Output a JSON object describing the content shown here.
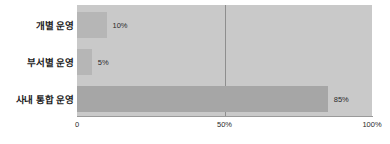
{
  "chart_data": {
    "type": "bar",
    "orientation": "horizontal",
    "title": "",
    "xlabel": "",
    "ylabel": "",
    "categories": [
      "개별 운영",
      "부서별 운영",
      "사내 통합 운영"
    ],
    "values": [
      10,
      5,
      85
    ],
    "value_labels": [
      "10%",
      "5%",
      "85%"
    ],
    "xlim": [
      0,
      100
    ],
    "xticks": [
      0,
      50,
      100
    ],
    "xtick_labels": [
      "0",
      "50%",
      "100%"
    ],
    "grid": true,
    "gridlines_at": [
      50
    ],
    "legend": null,
    "colors": {
      "plot_background": "#c9c9c9",
      "bar_light": "#b6b6b6",
      "bar_dark": "#a6a6a6",
      "gridline": "#8e8e8e",
      "axis_line": "#9a9a9a",
      "text": "#2a2a2a",
      "category_text": "#1c1c1c",
      "page_background": "#ffffff"
    },
    "bar_colors": [
      "#b6b6b6",
      "#b6b6b6",
      "#a6a6a6"
    ]
  }
}
